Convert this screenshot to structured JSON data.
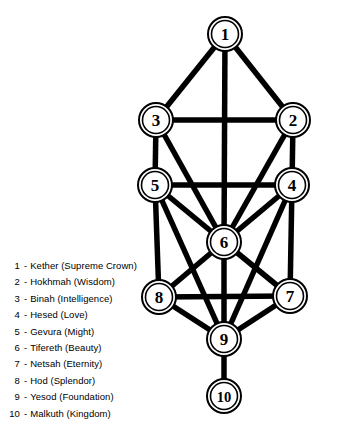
{
  "diagram": {
    "node_count": 10,
    "edge_count": 22,
    "colors": {
      "background": "#ffffff",
      "stroke": "#000000",
      "node_fill": "#ffffff"
    }
  },
  "nodes": [
    {
      "id": 1,
      "label": "1",
      "name": "Kether",
      "x": 225,
      "y": 34,
      "r_outer": 17,
      "r_inner": 13.5
    },
    {
      "id": 2,
      "label": "2",
      "name": "Hokhmah",
      "x": 293,
      "y": 120,
      "r_outer": 17,
      "r_inner": 13.5
    },
    {
      "id": 3,
      "label": "3",
      "name": "Binah",
      "x": 156,
      "y": 120,
      "r_outer": 17,
      "r_inner": 13.5
    },
    {
      "id": 4,
      "label": "4",
      "name": "Hesed",
      "x": 292,
      "y": 185,
      "r_outer": 17,
      "r_inner": 13.5
    },
    {
      "id": 5,
      "label": "5",
      "name": "Gevura",
      "x": 155,
      "y": 185,
      "r_outer": 17,
      "r_inner": 13.5
    },
    {
      "id": 6,
      "label": "6",
      "name": "Tifereth",
      "x": 224,
      "y": 242,
      "r_outer": 17,
      "r_inner": 13.5
    },
    {
      "id": 7,
      "label": "7",
      "name": "Netsah",
      "x": 290,
      "y": 296,
      "r_outer": 17,
      "r_inner": 13.5
    },
    {
      "id": 8,
      "label": "8",
      "name": "Hod",
      "x": 159,
      "y": 297,
      "r_outer": 17,
      "r_inner": 13.5
    },
    {
      "id": 9,
      "label": "9",
      "name": "Yesod",
      "x": 224,
      "y": 339,
      "r_outer": 17,
      "r_inner": 13.5
    },
    {
      "id": 10,
      "label": "10",
      "name": "Malkuth",
      "x": 224,
      "y": 396,
      "r_outer": 17,
      "r_inner": 13.5
    }
  ],
  "edges": [
    {
      "from": 1,
      "to": 3
    },
    {
      "from": 1,
      "to": 2
    },
    {
      "from": 1,
      "to": 6
    },
    {
      "from": 3,
      "to": 2
    },
    {
      "from": 3,
      "to": 5
    },
    {
      "from": 3,
      "to": 6
    },
    {
      "from": 2,
      "to": 4
    },
    {
      "from": 2,
      "to": 6
    },
    {
      "from": 5,
      "to": 4
    },
    {
      "from": 5,
      "to": 6
    },
    {
      "from": 5,
      "to": 8
    },
    {
      "from": 4,
      "to": 6
    },
    {
      "from": 4,
      "to": 7
    },
    {
      "from": 6,
      "to": 8
    },
    {
      "from": 6,
      "to": 7
    },
    {
      "from": 6,
      "to": 9
    },
    {
      "from": 8,
      "to": 7
    },
    {
      "from": 8,
      "to": 9
    },
    {
      "from": 7,
      "to": 9
    },
    {
      "from": 9,
      "to": 10
    },
    {
      "from": 5,
      "to": 9
    },
    {
      "from": 4,
      "to": 9
    }
  ],
  "legend": {
    "separator": "-",
    "items": [
      {
        "index": "1",
        "label": "Kether (Supreme Crown)"
      },
      {
        "index": "2",
        "label": "Hokhmah (Wisdom)"
      },
      {
        "index": "3",
        "label": "Binah (Intelligence)"
      },
      {
        "index": "4",
        "label": "Hesed (Love)"
      },
      {
        "index": "5",
        "label": "Gevura (Might)"
      },
      {
        "index": "6",
        "label": "Tifereth (Beauty)"
      },
      {
        "index": "7",
        "label": "Netsah (Eternity)"
      },
      {
        "index": "8",
        "label": "Hod (Splendor)"
      },
      {
        "index": "9",
        "label": "Yesod (Foundation)"
      },
      {
        "index": "10",
        "label": "Malkuth (Kingdom)"
      }
    ]
  }
}
